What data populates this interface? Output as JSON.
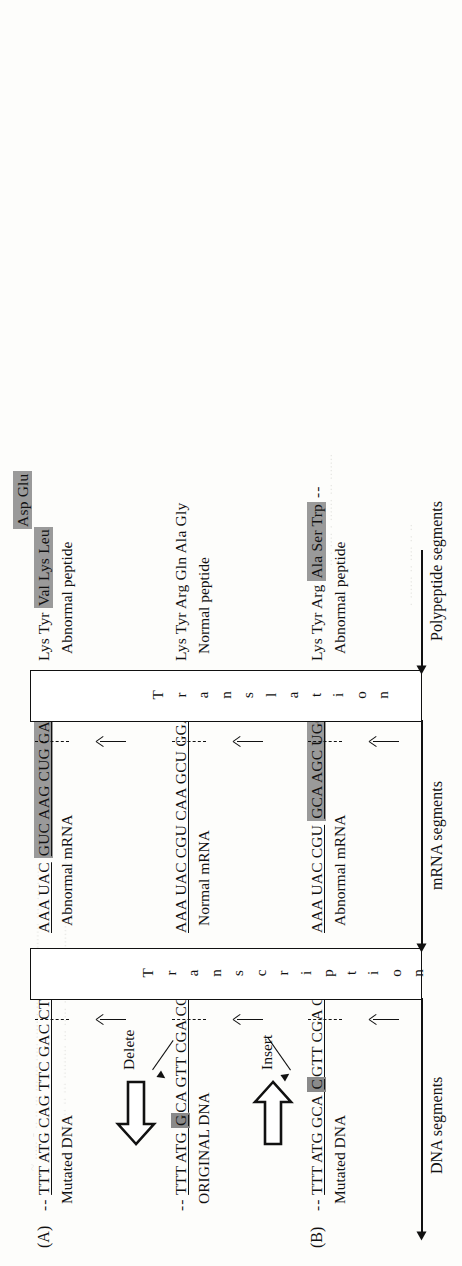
{
  "figure": {
    "orientation": "rotated-90"
  },
  "rows": {
    "a": {
      "label": "(A)",
      "dna": {
        "prefix": "--",
        "text": "TTT ATG CAG TTC GAC CT",
        "suffix": "--",
        "caption": "Mutated DNA"
      },
      "mrna": {
        "prefix": "",
        "lead": "AAA UAC",
        "highlight": "GUC AAG CUG GA",
        "suffix": "--",
        "caption": "Abnormal mRNA"
      },
      "peptide": {
        "lead": "Lys Tyr",
        "highlight_line1": "Val Lys Leu",
        "highlight_line2": "Asp   Glu",
        "caption": "Abnormal peptide"
      }
    },
    "original": {
      "label": "",
      "dna": {
        "prefix": "--",
        "pre": "TTT ATG ",
        "mutated_base": "G",
        "post": "CA GTT CGA CCT",
        "suffix": "--",
        "caption": "ORIGINAL DNA",
        "mutation_note": "Delete"
      },
      "mrna": {
        "lead": "AAA UAC CGU CAA GCU GGA",
        "suffix": "--",
        "caption": "Normal mRNA"
      },
      "peptide": {
        "lead": "Lys Tyr Arg Gln Ala Gly",
        "caption": "Normal peptide"
      }
    },
    "b": {
      "label": "(B)",
      "dna": {
        "prefix": "--",
        "pre": "TTT ATG GCA ",
        "mutated_base": "C",
        "post": "GTT CGA CCT",
        "suffix": "--",
        "caption": "Mutated DNA",
        "mutation_note": "Insert"
      },
      "mrna": {
        "lead": "AAA UAC CGU",
        "highlight": "GCA AGC UGG A",
        "suffix": "",
        "caption": "Abnormal mRNA"
      },
      "peptide": {
        "lead": "Lys Tyr Arg",
        "highlight": "Ala Ser Trp",
        "suffix": "--",
        "caption": "Abnormal peptide"
      }
    }
  },
  "processes": {
    "transcription": "Transcription",
    "translation": "Translation"
  },
  "axis_labels": {
    "dna": "DNA segments",
    "mrna": "mRNA segments",
    "polypeptide": "Polypeptide segments"
  },
  "colors": {
    "highlight_gray": "#9a9a9a",
    "ink": "#111111",
    "paper": "#fdfdfb"
  },
  "scan_artifacts": [
    "faint background text bleed-through",
    "faint background text bleed-through",
    "faint background text bleed-through",
    "faint background text bleed-through"
  ]
}
